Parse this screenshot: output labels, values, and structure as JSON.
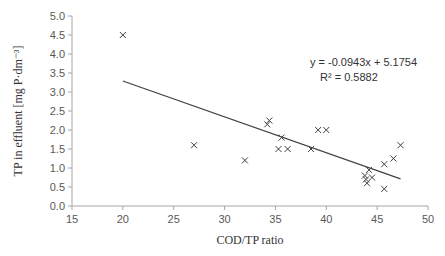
{
  "chart_data": {
    "type": "scatter",
    "title": "",
    "xlabel": "COD/TP ratio",
    "ylabel": "TP in effluent [mg P·dm⁻³]",
    "xlim": [
      15,
      50
    ],
    "ylim": [
      0,
      5
    ],
    "xticks": [
      "15",
      "20",
      "25",
      "30",
      "35",
      "40",
      "45",
      "50"
    ],
    "yticks": [
      "0.0",
      "0.5",
      "1.0",
      "1.5",
      "2.0",
      "2.5",
      "3.0",
      "3.5",
      "4.0",
      "4.5",
      "5.0"
    ],
    "grid": false,
    "legend": null,
    "marker": "x",
    "points": [
      [
        20.0,
        4.5
      ],
      [
        27.0,
        1.6
      ],
      [
        32.0,
        1.2
      ],
      [
        34.2,
        2.15
      ],
      [
        34.4,
        2.25
      ],
      [
        35.3,
        1.5
      ],
      [
        35.6,
        1.8
      ],
      [
        36.2,
        1.5
      ],
      [
        38.5,
        1.5
      ],
      [
        39.2,
        2.0
      ],
      [
        40.0,
        2.0
      ],
      [
        43.8,
        0.8
      ],
      [
        43.9,
        0.7
      ],
      [
        44.0,
        0.6
      ],
      [
        44.2,
        0.95
      ],
      [
        44.5,
        0.75
      ],
      [
        45.7,
        1.1
      ],
      [
        45.7,
        0.45
      ],
      [
        46.6,
        1.25
      ],
      [
        47.3,
        1.6
      ]
    ],
    "trendline": {
      "type": "linear",
      "slope": -0.0943,
      "intercept": 5.1754,
      "x_range": [
        20,
        47.3
      ],
      "equation": "y = -0.0943x + 5.1754",
      "r_squared": "R² = 0.5882"
    }
  }
}
